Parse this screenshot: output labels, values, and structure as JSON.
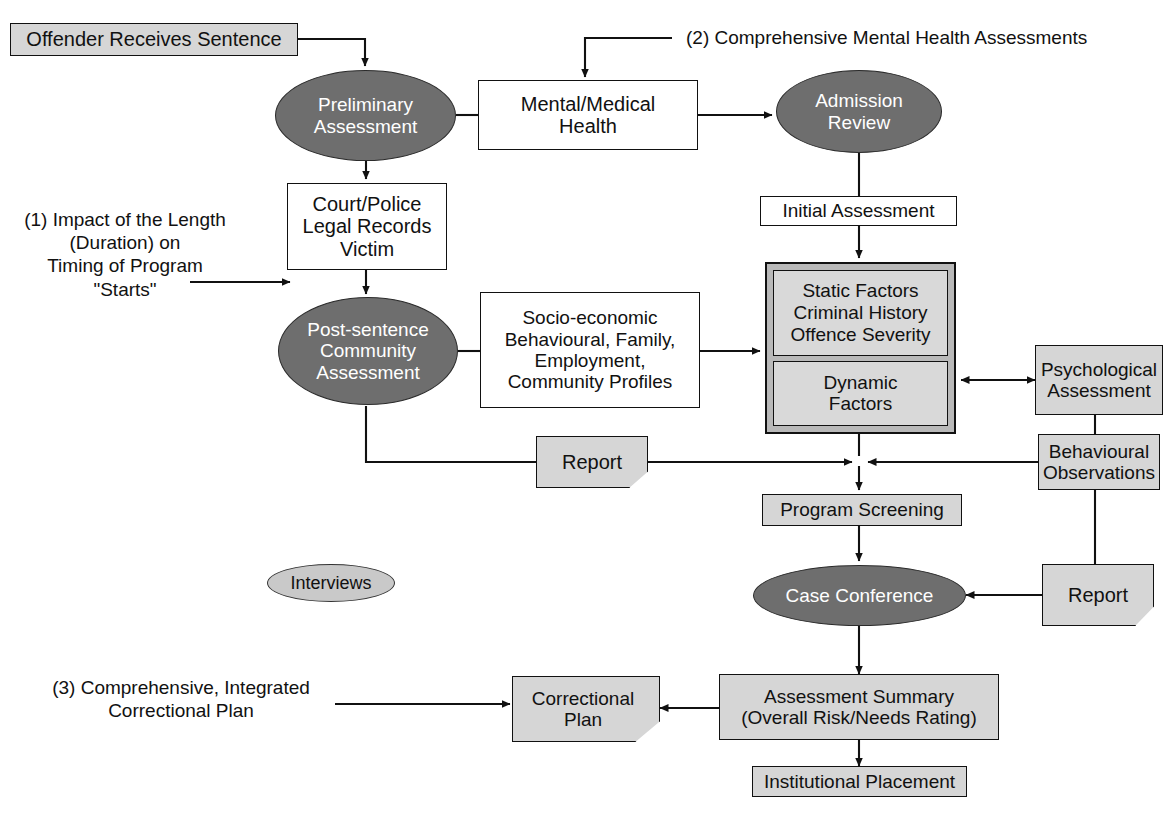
{
  "diagram": {
    "colors": {
      "dark_ellipse_fill": "#6e6e6e",
      "light_ellipse_fill": "#c9c9c9",
      "grey_box_fill": "#d6d6d6",
      "panel_outer_fill": "#b9b9b9",
      "panel_inner_fill": "#d9d9d9",
      "white_box_fill": "#ffffff",
      "line": "#111111",
      "canvas": "#ffffff"
    },
    "annotations": [
      {
        "id": "note1",
        "text": "(1) Impact of the Length\n(Duration) on\nTiming of Program\n\"Starts\""
      },
      {
        "id": "note2",
        "text": "(2)  Comprehensive Mental Health Assessments"
      },
      {
        "id": "note3",
        "text": "(3) Comprehensive, Integrated\nCorrectional Plan"
      }
    ],
    "nodes": [
      {
        "id": "offender_receives_sentence",
        "label": "Offender Receives Sentence",
        "shape": "rect-grey"
      },
      {
        "id": "preliminary_assessment",
        "label": "Preliminary\nAssessment",
        "shape": "ellipse-dark"
      },
      {
        "id": "mental_medical_health",
        "label": "Mental/Medical\nHealth",
        "shape": "rect-white"
      },
      {
        "id": "admission_review",
        "label": "Admission\nReview",
        "shape": "ellipse-dark"
      },
      {
        "id": "court_police_legal_records_victim",
        "label": "Court/Police\nLegal Records\nVictim",
        "shape": "rect-white"
      },
      {
        "id": "initial_assessment",
        "label": "Initial Assessment",
        "shape": "rect-white"
      },
      {
        "id": "post_sentence_community_assessment",
        "label": "Post-sentence\nCommunity\nAssessment",
        "shape": "ellipse-dark"
      },
      {
        "id": "socio_economic_profiles",
        "label": "Socio-economic\nBehavioural, Family,\nEmployment,\nCommunity Profiles",
        "shape": "rect-white"
      },
      {
        "id": "static_factors",
        "label": "Static Factors\nCriminal History\nOffence Severity",
        "shape": "panel-inner"
      },
      {
        "id": "dynamic_factors",
        "label": "Dynamic\nFactors",
        "shape": "panel-inner"
      },
      {
        "id": "psychological_assessment",
        "label": "Psychological\nAssessment",
        "shape": "rect-grey"
      },
      {
        "id": "behavioural_observations",
        "label": "Behavioural\nObservations",
        "shape": "rect-grey"
      },
      {
        "id": "report_left",
        "label": "Report",
        "shape": "document"
      },
      {
        "id": "report_right",
        "label": "Report",
        "shape": "document"
      },
      {
        "id": "program_screening",
        "label": "Program Screening",
        "shape": "rect-grey"
      },
      {
        "id": "interviews",
        "label": "Interviews",
        "shape": "ellipse-light"
      },
      {
        "id": "case_conference",
        "label": "Case Conference",
        "shape": "ellipse-dark"
      },
      {
        "id": "correctional_plan",
        "label": "Correctional\nPlan",
        "shape": "document"
      },
      {
        "id": "assessment_summary",
        "label": "Assessment Summary\n(Overall Risk/Needs Rating)",
        "shape": "rect-grey"
      },
      {
        "id": "institutional_placement",
        "label": "Institutional Placement",
        "shape": "rect-grey"
      }
    ]
  }
}
